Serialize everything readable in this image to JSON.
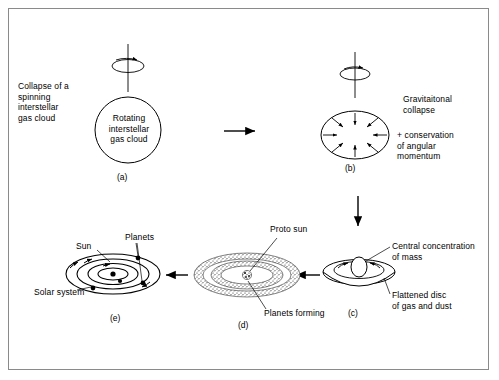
{
  "diagram": {
    "stroke_color": "#000000",
    "frame_color": "#8a8a8a",
    "background": "#ffffff"
  },
  "panels": [
    {
      "id": "a",
      "letter": "(a)",
      "caption": "Collapse of a\nspinning\ninterstellar\ngas cloud",
      "body_text": "Rotating\ninterstellar\ngas cloud",
      "shape": "circle",
      "has_spin_symbol": true
    },
    {
      "id": "b",
      "letter": "(b)",
      "caption": "Gravitaitonal\ncollapse",
      "caption2": "+ conservation\nof angular\nmomentum",
      "shape": "ellipse-with-inward-arrows",
      "inward_arrow_count": 8,
      "has_spin_symbol": true
    },
    {
      "id": "c",
      "letter": "(c)",
      "label_top": "Central concentration\nof mass",
      "label_bottom": "Flattened disc\nof gas and dust",
      "shape": "flattened-disc"
    },
    {
      "id": "d",
      "letter": "(d)",
      "label_top": "Proto sun",
      "label_bottom": "Planets forming",
      "shape": "stippled-concentric-rings",
      "ring_count": 2
    },
    {
      "id": "e",
      "letter": "(e)",
      "label_sun": "Sun",
      "label_planets": "Planets",
      "label_system": "Solar system",
      "shape": "concentric-orbits",
      "orbit_count": 4,
      "planet_count": 4
    }
  ],
  "flow_arrows": [
    {
      "name": "a-to-b",
      "direction": "right"
    },
    {
      "name": "b-to-c",
      "direction": "down"
    },
    {
      "name": "c-to-d",
      "direction": "left"
    },
    {
      "name": "d-to-e",
      "direction": "left"
    }
  ]
}
